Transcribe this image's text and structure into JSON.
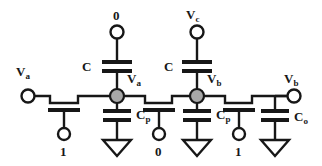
{
  "figure": {
    "kind": "circuit-schematic",
    "colors": {
      "wire": "#171717",
      "node_fill": "#a8a8a8",
      "node_stroke": "#171717",
      "terminal_fill": "#ffffff",
      "background": "#ffffff"
    }
  },
  "labels": {
    "input_terminal": "V",
    "input_terminal_sub": "a",
    "top_left_source": "0",
    "top_right_source": "V",
    "top_right_source_sub": "c",
    "cap_left": "C",
    "cap_right": "C",
    "node_a": "V",
    "node_a_sub": "a",
    "node_b": "V",
    "node_b_sub": "b",
    "output_terminal": "V",
    "output_terminal_sub": "b",
    "parasitic_cap_left": "C",
    "parasitic_cap_left_sub": "p",
    "parasitic_cap_right": "C",
    "parasitic_cap_right_sub": "p",
    "output_cap": "C",
    "output_cap_sub": "o",
    "gate_1": "1",
    "gate_2": "0",
    "gate_3": "1"
  },
  "elements": {
    "transistors": [
      {
        "name": "pass-transistor-1",
        "gate_signal": "1"
      },
      {
        "name": "pass-transistor-2",
        "gate_signal": "0"
      },
      {
        "name": "pass-transistor-3",
        "gate_signal": "1"
      }
    ],
    "capacitors": [
      {
        "name": "coupling-capacitor-left",
        "label": "C",
        "top_terminal": "0"
      },
      {
        "name": "coupling-capacitor-right",
        "label": "C",
        "top_terminal": "Vc"
      },
      {
        "name": "parasitic-capacitor-a",
        "label": "Cp",
        "bottom": "ground"
      },
      {
        "name": "parasitic-capacitor-b",
        "label": "Cp",
        "bottom": "ground"
      },
      {
        "name": "output-capacitor",
        "label": "Co",
        "bottom": "ground"
      }
    ],
    "nodes": [
      {
        "name": "node-va",
        "label": "Va"
      },
      {
        "name": "node-vb",
        "label": "Vb"
      }
    ],
    "grounds": 3
  }
}
